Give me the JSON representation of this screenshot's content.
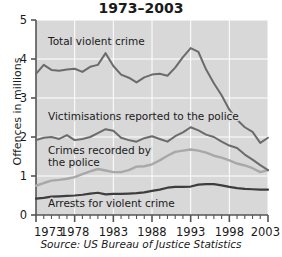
{
  "chart_data": {
    "type": "line",
    "title": "1973–2003",
    "xlabel": "",
    "ylabel": "Offences in millions",
    "source": "Source: US Bureau of Justice Statistics",
    "grid": true,
    "legend_position": "inline-labels",
    "xlim": [
      1973,
      2003
    ],
    "ylim": [
      0,
      5
    ],
    "ytick_labels": [
      "0",
      "1",
      "2",
      "3",
      "4",
      "5"
    ],
    "ytick_values": [
      0,
      1,
      2,
      3,
      4,
      5
    ],
    "xtick_labels": [
      "1973",
      "1978",
      "1983",
      "1988",
      "1993",
      "1998",
      "2003"
    ],
    "xtick_values": [
      1973,
      1978,
      1983,
      1988,
      1993,
      1998,
      2003
    ],
    "x": [
      1973,
      1974,
      1975,
      1976,
      1977,
      1978,
      1979,
      1980,
      1981,
      1982,
      1983,
      1984,
      1985,
      1986,
      1987,
      1988,
      1989,
      1990,
      1991,
      1992,
      1993,
      1994,
      1995,
      1996,
      1997,
      1998,
      1999,
      2000,
      2001,
      2002,
      2003
    ],
    "series": [
      {
        "name": "Total violent crime",
        "color": "#6b6b6b",
        "width": 2.0,
        "values": [
          3.62,
          3.85,
          3.72,
          3.7,
          3.73,
          3.75,
          3.67,
          3.8,
          3.85,
          4.15,
          3.82,
          3.6,
          3.52,
          3.4,
          3.53,
          3.6,
          3.62,
          3.57,
          3.78,
          4.05,
          4.28,
          4.18,
          3.73,
          3.38,
          3.07,
          2.7,
          2.44,
          2.25,
          2.13,
          1.85,
          1.98
        ]
      },
      {
        "name": "Victimisations reported to the police",
        "color": "#6b6b6b",
        "width": 2.0,
        "values": [
          1.92,
          1.98,
          2.0,
          1.95,
          2.05,
          1.92,
          1.95,
          2.0,
          2.1,
          2.2,
          2.16,
          1.98,
          1.92,
          1.88,
          1.97,
          2.02,
          1.95,
          1.88,
          2.02,
          2.12,
          2.25,
          2.17,
          2.06,
          2.0,
          1.88,
          1.78,
          1.72,
          1.55,
          1.42,
          1.28,
          1.15
        ]
      },
      {
        "name": "Crimes recorded by the police",
        "color": "#a8a8a8",
        "width": 2.4,
        "values": [
          0.75,
          0.82,
          0.88,
          0.9,
          0.93,
          0.97,
          1.05,
          1.12,
          1.18,
          1.14,
          1.1,
          1.1,
          1.15,
          1.24,
          1.25,
          1.3,
          1.4,
          1.52,
          1.62,
          1.65,
          1.68,
          1.65,
          1.6,
          1.52,
          1.47,
          1.4,
          1.32,
          1.27,
          1.2,
          1.1,
          1.15
        ]
      },
      {
        "name": "Arrests for violent crime",
        "color": "#3d3d3d",
        "width": 2.2,
        "values": [
          0.42,
          0.44,
          0.47,
          0.48,
          0.49,
          0.5,
          0.52,
          0.55,
          0.57,
          0.53,
          0.54,
          0.54,
          0.55,
          0.56,
          0.58,
          0.62,
          0.65,
          0.7,
          0.72,
          0.72,
          0.73,
          0.78,
          0.79,
          0.79,
          0.76,
          0.72,
          0.69,
          0.67,
          0.66,
          0.65,
          0.65
        ]
      }
    ],
    "annotations": [
      {
        "id": "label-total-violent-crime",
        "text": "Total violent crime",
        "x": 48,
        "y": 45
      },
      {
        "id": "label-victimisations",
        "text": "Victimisations reported to the police",
        "x": 48,
        "y": 120
      },
      {
        "id": "label-crimes-recorded-line1",
        "text": "Crimes recorded by",
        "x": 48,
        "y": 154
      },
      {
        "id": "label-crimes-recorded-line2",
        "text": "the police",
        "x": 48,
        "y": 166
      },
      {
        "id": "label-arrests",
        "text": "Arrests for violent crime",
        "x": 48,
        "y": 207
      }
    ],
    "colors": {
      "plot_background": "#d8d8d8",
      "gridline": "#ffffff",
      "axis": "#555555",
      "text": "#1a1a1a",
      "page_background": "#ffffff"
    }
  }
}
